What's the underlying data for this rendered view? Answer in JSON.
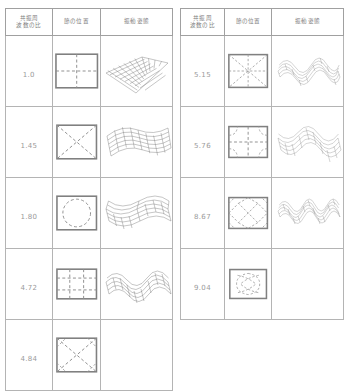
{
  "table": {
    "headers": {
      "ratio": "共振周\n波数の比",
      "ratio_line1": "共振周",
      "ratio_line2": "波数の比",
      "node": "節の位置",
      "shape": "振動姿態"
    },
    "left_rows": [
      {
        "ratio": "1.0",
        "node_pattern": "cross",
        "shape": "tilted-flat-mesh",
        "has_shape": true
      },
      {
        "ratio": "1.45",
        "node_pattern": "diagonal-x",
        "shape": "saddle-mesh",
        "has_shape": true
      },
      {
        "ratio": "1.80",
        "node_pattern": "circle",
        "shape": "dome-wave-mesh",
        "has_shape": true
      },
      {
        "ratio": "4.72",
        "node_pattern": "grid-3x3",
        "shape": "basin-ripple-mesh",
        "has_shape": true
      },
      {
        "ratio": "4.84",
        "node_pattern": "x-with-corners",
        "shape": "",
        "has_shape": false
      }
    ],
    "right_rows": [
      {
        "ratio": "5.15",
        "node_pattern": "eight-ray-star",
        "shape": "multi-lobe-mesh",
        "has_shape": true
      },
      {
        "ratio": "5.76",
        "node_pattern": "cross-with-arcs",
        "shape": "rippled-sheet-mesh",
        "has_shape": true
      },
      {
        "ratio": "8.67",
        "node_pattern": "diamond-lattice",
        "shape": "high-order-mesh",
        "has_shape": true
      },
      {
        "ratio": "9.04",
        "node_pattern": "clover-loops",
        "shape": "",
        "has_shape": false
      }
    ]
  },
  "colors": {
    "border": "#b4b4b4",
    "outer_border": "#8a8a8a",
    "text": "#7d7d7d",
    "value_text": "#9a9a9a",
    "node_stroke": "#8f8f8f",
    "mesh_stroke": "#6f6f6f",
    "background": "#ffffff"
  }
}
